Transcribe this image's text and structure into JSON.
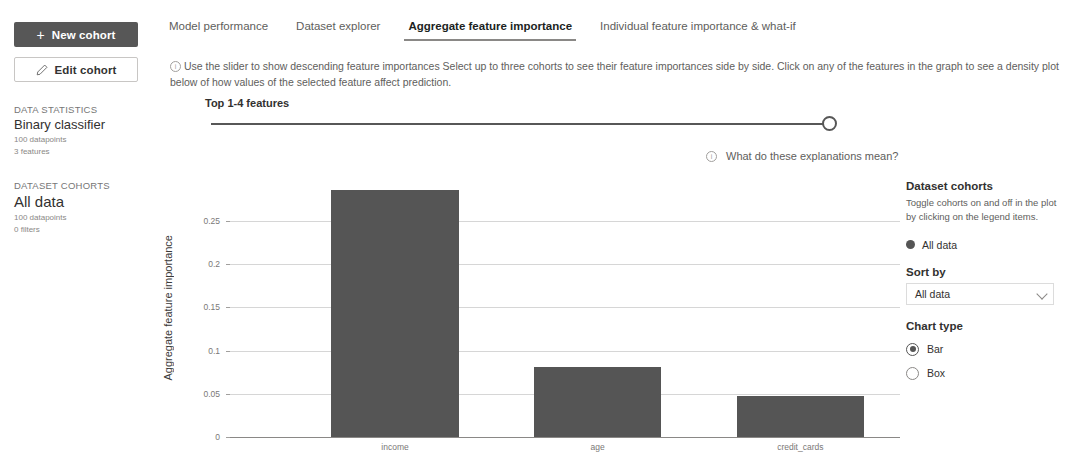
{
  "sidebar": {
    "new_cohort_label": "New cohort",
    "edit_cohort_label": "Edit cohort",
    "data_statistics": {
      "caption": "DATA STATISTICS",
      "title": "Binary classifier",
      "datapoints": "100 datapoints",
      "features": "3 features"
    },
    "dataset_cohorts": {
      "caption": "DATASET COHORTS",
      "title": "All data",
      "datapoints": "100 datapoints",
      "filters": "0 filters"
    }
  },
  "tabs": [
    {
      "label": "Model performance",
      "active": false
    },
    {
      "label": "Dataset explorer",
      "active": false
    },
    {
      "label": "Aggregate feature importance",
      "active": true
    },
    {
      "label": "Individual feature importance & what-if",
      "active": false
    }
  ],
  "info": {
    "text": "Use the slider to show descending feature importances  Select up to three cohorts to see their feature importances side by side. Click on any of the features in the graph to see a density plot below of how values of the selected feature affect prediction."
  },
  "slider": {
    "label": "Top 1-4 features",
    "min": 1,
    "max": 4,
    "value": 4
  },
  "explain_link": {
    "label": "What do these explanations mean?"
  },
  "right_panel": {
    "cohorts_heading": "Dataset cohorts",
    "cohorts_description": "Toggle cohorts on and off in the plot by clicking on the legend items.",
    "legend": [
      {
        "label": "All data",
        "color": "#555555"
      }
    ],
    "sort_by_heading": "Sort by",
    "sort_by_value": "All data",
    "sort_by_options": [
      "All data"
    ],
    "chart_type_heading": "Chart type",
    "chart_type_options": [
      {
        "label": "Bar",
        "checked": true
      },
      {
        "label": "Box",
        "checked": false
      }
    ]
  },
  "chart_data": {
    "type": "bar",
    "title": "",
    "xlabel": "",
    "ylabel": "Aggregate feature importance",
    "categories": [
      "income",
      "age",
      "credit_cards"
    ],
    "values": [
      0.286,
      0.081,
      0.047
    ],
    "series": [
      {
        "name": "All data",
        "values": [
          0.286,
          0.081,
          0.047
        ],
        "color": "#555555"
      }
    ],
    "ylim": [
      0,
      0.2975
    ],
    "yticks": [
      0,
      0.05,
      0.1,
      0.15,
      0.2,
      0.25
    ],
    "ytick_labels": [
      "0",
      "0.05",
      "0.1",
      "0.15",
      "0.2",
      "0.25"
    ],
    "grid": true,
    "legend_position": "right"
  },
  "colors": {
    "accent": "#555555",
    "bar": "#555555",
    "grid": "#d6d6d6",
    "text_muted": "#605e5c"
  }
}
